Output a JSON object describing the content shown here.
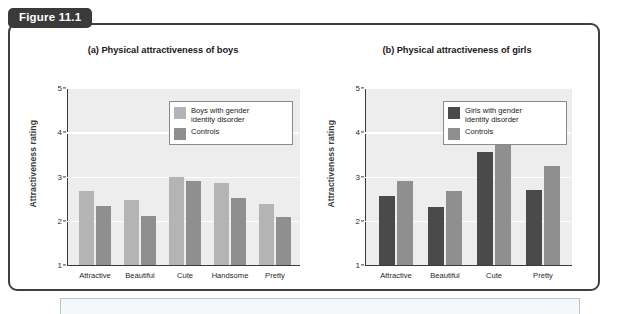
{
  "figure": {
    "tag_label": "Figure 11.1"
  },
  "chart_data": [
    {
      "type": "bar",
      "panel_id": "a",
      "title": "(a) Physical attractiveness of boys",
      "xlabel": "",
      "ylabel": "Attractiveness rating",
      "ylim": [
        1,
        5
      ],
      "yticks": [
        1,
        2,
        3,
        4,
        5
      ],
      "ytick_labels": [
        "1",
        "2",
        "3",
        "4",
        "5"
      ],
      "grid": true,
      "legend_position": "top-right",
      "categories": [
        "Attractive",
        "Beautiful",
        "Cute",
        "Handsome",
        "Pretty"
      ],
      "series": [
        {
          "name": "Boys with gender\nidentity disorder",
          "legend_label": "Boys with gender\nidentity disorder",
          "color": "#b4b4b4",
          "values": [
            2.68,
            2.48,
            3.0,
            2.85,
            2.37
          ]
        },
        {
          "name": "Controls",
          "legend_label": "Controls",
          "color": "#8f8f8f",
          "values": [
            2.33,
            2.1,
            2.9,
            2.52,
            2.08
          ]
        }
      ]
    },
    {
      "type": "bar",
      "panel_id": "b",
      "title": "(b) Physical attractiveness of girls",
      "xlabel": "",
      "ylabel": "Attractiveness rating",
      "ylim": [
        1,
        5
      ],
      "yticks": [
        1,
        2,
        3,
        4,
        5
      ],
      "ytick_labels": [
        "1",
        "2",
        "3",
        "4",
        "5"
      ],
      "grid": true,
      "legend_position": "top-right",
      "categories": [
        "Attractive",
        "Beautiful",
        "Cute",
        "Pretty"
      ],
      "series": [
        {
          "name": "Girls with gender\nidentity disorder",
          "legend_label": "Girls with gender\nidentity disorder",
          "color": "#4a4a4a",
          "values": [
            2.57,
            2.32,
            3.55,
            2.7
          ]
        },
        {
          "name": "Controls",
          "legend_label": "Controls",
          "color": "#8f8f8f",
          "values": [
            2.9,
            2.67,
            3.72,
            3.23
          ]
        }
      ]
    }
  ]
}
